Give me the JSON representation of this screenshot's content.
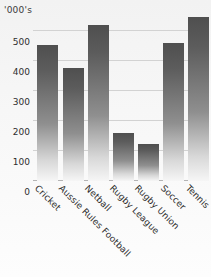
{
  "chart_data": {
    "type": "bar",
    "title": "",
    "subtitle": "",
    "unit_caption": "'000's",
    "xlabel": "",
    "ylabel": "",
    "ylim": [
      0,
      560
    ],
    "yticks": [
      0,
      100,
      200,
      300,
      400,
      500
    ],
    "ytick_labels": [
      "0",
      "100",
      "200",
      "300",
      "400",
      "500"
    ],
    "grid": true,
    "legend": false,
    "legend_position": "none",
    "categories": [
      "Cricket",
      "Aussie Rules Football",
      "Netball",
      "Rugby League",
      "Rugby Union",
      "Soccer",
      "Tennis"
    ],
    "values": [
      455,
      378,
      520,
      160,
      123,
      460,
      547
    ],
    "bar_color": "#555555",
    "gridline_color": "#d2d2d2",
    "background_color": "#f4f4f4"
  }
}
